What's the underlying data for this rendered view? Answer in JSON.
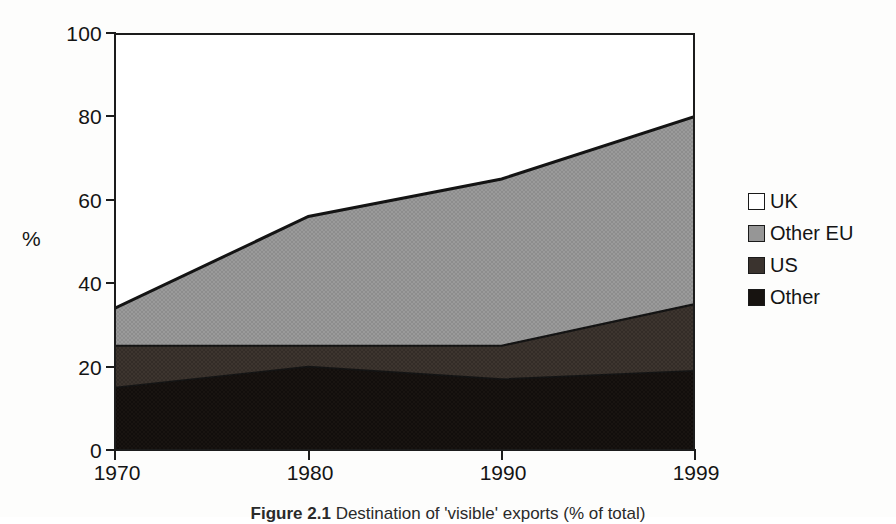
{
  "figure": {
    "caption_prefix": "Figure  2.1",
    "caption_text": "Destination of 'visible' exports (% of total)"
  },
  "chart_data": {
    "type": "area",
    "stacked": true,
    "title": "",
    "xlabel": "",
    "ylabel": "%",
    "x": [
      1970,
      1980,
      1990,
      1999
    ],
    "x_tick_labels": [
      "1970",
      "1980",
      "1990",
      "1999"
    ],
    "y_tick_labels": [
      "0",
      "20",
      "40",
      "60",
      "80",
      "100"
    ],
    "y_ticks": [
      0,
      20,
      40,
      60,
      80,
      100
    ],
    "ylim": [
      0,
      100
    ],
    "grid": false,
    "legend_position": "right",
    "stack_order_bottom_to_top": [
      "Other",
      "US",
      "Other EU",
      "UK"
    ],
    "series": [
      {
        "name": "Other",
        "values": [
          15,
          20,
          17,
          19
        ],
        "color": "#171310"
      },
      {
        "name": "US",
        "values": [
          10,
          5,
          8,
          16
        ],
        "color": "#3a332e"
      },
      {
        "name": "Other EU",
        "values": [
          9,
          31,
          40,
          45
        ],
        "color": "#969696"
      },
      {
        "name": "UK",
        "values": [
          66,
          44,
          35,
          20
        ],
        "color": "#ffffff"
      }
    ],
    "cumulative_tops": {
      "Other": [
        15,
        20,
        17,
        19
      ],
      "US": [
        25,
        25,
        25,
        35
      ],
      "Other EU": [
        34,
        56,
        65,
        80
      ],
      "UK": [
        100,
        100,
        100,
        100
      ]
    }
  },
  "legend": {
    "items": [
      {
        "label": "UK",
        "color": "#ffffff"
      },
      {
        "label": "Other EU",
        "color": "#969696"
      },
      {
        "label": "US",
        "color": "#3a332e"
      },
      {
        "label": "Other",
        "color": "#171310"
      }
    ]
  }
}
